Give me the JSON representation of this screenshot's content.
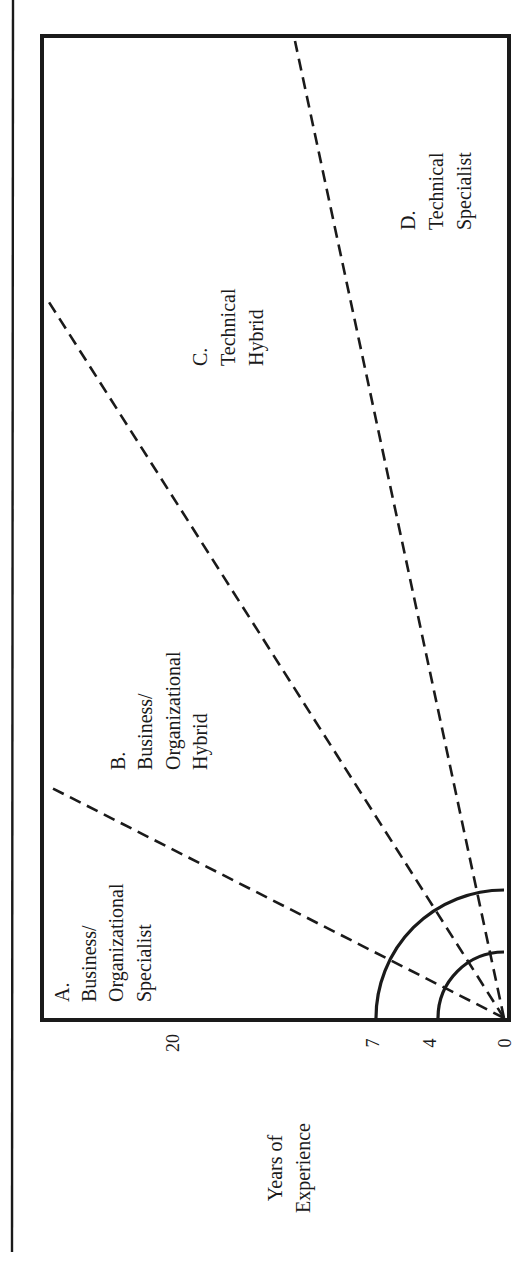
{
  "figure": {
    "orientation": "rotated-90-ccw",
    "colors": {
      "ink": "#1a1a1a",
      "background": "#ffffff"
    }
  },
  "axis": {
    "label_line1": "Years of",
    "label_line2": "Experience",
    "ticks": [
      "20",
      "7",
      "4",
      "0"
    ]
  },
  "regions": [
    {
      "id": "A",
      "lines": [
        "A.",
        "Business/",
        "Organizational",
        "Specialist"
      ]
    },
    {
      "id": "B",
      "lines": [
        "B.",
        "Business/",
        "Organizational",
        "Hybrid"
      ]
    },
    {
      "id": "C",
      "lines": [
        "C.",
        "Technical",
        "Hybrid"
      ]
    },
    {
      "id": "D",
      "lines": [
        "D.",
        "Technical",
        "Specialist"
      ]
    }
  ],
  "arcs": [
    {
      "years": "4"
    },
    {
      "years": "7"
    }
  ],
  "dividers": [
    {
      "between": "A-B"
    },
    {
      "between": "B-C"
    },
    {
      "between": "C-D"
    }
  ]
}
